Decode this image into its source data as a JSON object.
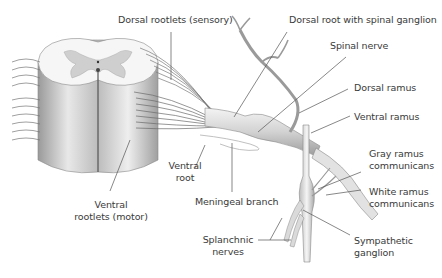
{
  "labels": {
    "dorsal_rootlets": "Dorsal rootlets (sensory)",
    "dorsal_root_ganglion": "Dorsal root with spinal ganglion",
    "spinal_nerve": "Spinal nerve",
    "dorsal_ramus": "Dorsal ramus",
    "ventral_ramus": "Ventral ramus",
    "gray_ramus_1": "Gray ramus",
    "gray_ramus_2": "communicans",
    "white_ramus_1": "White ramus",
    "white_ramus_2": "communicans",
    "ventral_root_1": "Ventral",
    "ventral_root_2": "root",
    "ventral_rootlets_1": "Ventral",
    "ventral_rootlets_2": "rootlets (motor)",
    "meningeal_branch": "Meningeal branch",
    "splanchnic_1": "Splanchnic",
    "splanchnic_2": "nerves",
    "sympathetic_1": "Sympathetic",
    "sympathetic_2": "ganglion"
  },
  "colors": {
    "leader_line": "#555555",
    "text": "#3a3a3a",
    "gray_matter": "#cfcfcf",
    "white_matter": "#f2f2f2",
    "nerve_fill": "#d9d9d9",
    "nerve_stroke": "#8a8a8a"
  }
}
